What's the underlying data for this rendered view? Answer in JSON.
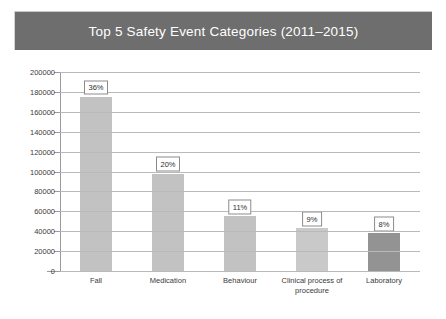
{
  "chart_data": {
    "type": "bar",
    "title": "Top 5 Safety Event Categories (2011–2015)",
    "xlabel": "",
    "ylabel": "",
    "categories": [
      "Fall",
      "Medication",
      "Behaviour",
      "Clinical process of procedure",
      "Laboratory"
    ],
    "values": [
      175000,
      98000,
      55000,
      43000,
      38000
    ],
    "data_labels": [
      "36%",
      "20%",
      "11%",
      "9%",
      "8%"
    ],
    "ylim": [
      0,
      200000
    ],
    "ytick_labels": [
      "200000",
      "180000",
      "160000",
      "140000",
      "120000",
      "100000",
      "80000",
      "60000",
      "40000",
      "20000",
      "0"
    ],
    "ytick_values": [
      200000,
      180000,
      160000,
      140000,
      120000,
      100000,
      80000,
      60000,
      40000,
      20000,
      0
    ],
    "grid": true,
    "legend": false,
    "bar_colors": [
      "#c2c2c2",
      "#c2c2c2",
      "#c2c2c2",
      "#c9c9c9",
      "#939393"
    ],
    "colors": {
      "title_banner": "#6e6e6e",
      "title_text": "#ffffff",
      "gridline": "#b9b9b9",
      "axis": "#9a9a9a",
      "background": "#ffffff",
      "tick_text": "#3a3a3a",
      "label_border": "#8c8c8c"
    }
  }
}
